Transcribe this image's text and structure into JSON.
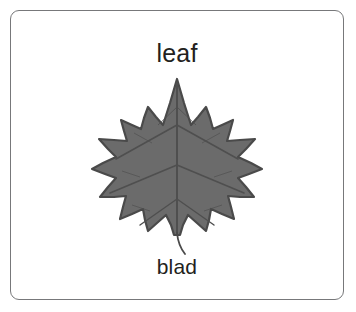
{
  "card": {
    "border_color": "#77787a",
    "background_color": "#ffffff",
    "label_color": "#231f20",
    "top_label": "leaf",
    "bottom_label": "blad"
  },
  "illustration": {
    "name": "maple-leaf",
    "fill_color": "#6b6b6b",
    "outline_color": "#4a4a4a",
    "vein_color": "#4f4f4f",
    "stem_color": "#4a4a4a",
    "lobes": 5,
    "description": "gray maple leaf with serrated lobes, palmate veins and a thin curved stem"
  }
}
